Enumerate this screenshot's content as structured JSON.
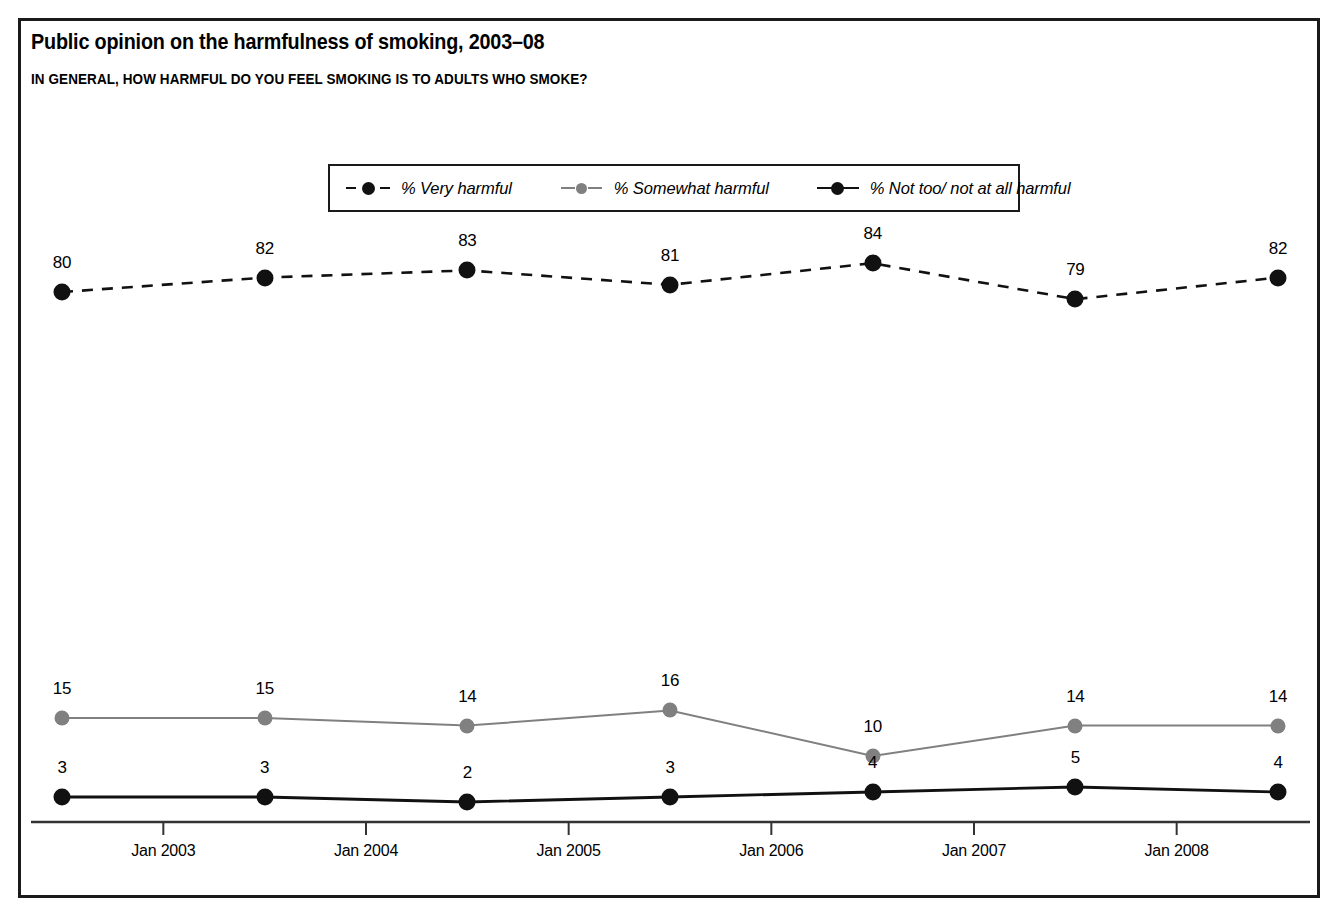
{
  "header": {
    "title": "Public opinion on the harmfulness of smoking, 2003–08",
    "subtitle": "IN GENERAL, HOW HARMFUL DO YOU FEEL SMOKING IS TO ADULTS WHO SMOKE?"
  },
  "colors": {
    "very_harmful": "#111111",
    "somewhat_harmful": "#808080",
    "not_harmful": "#111111",
    "axis": "#333333",
    "frame": "#1a1a1a",
    "background": "#ffffff"
  },
  "chart_data": {
    "type": "line",
    "title": "Public opinion on the harmfulness of smoking, 2003–08",
    "subtitle": "IN GENERAL, HOW HARMFUL DO YOU FEEL SMOKING IS TO ADULTS WHO SMOKE?",
    "xlabel": "",
    "ylabel": "",
    "grid": false,
    "legend_position": "top-center",
    "x_tick_labels": [
      "Jan 2003",
      "Jan 2004",
      "Jan 2005",
      "Jan 2006",
      "Jan 2007",
      "Jan 2008"
    ],
    "categories": [
      "2002",
      "2003",
      "2004",
      "2005",
      "2006",
      "2007",
      "2008"
    ],
    "series": [
      {
        "name": "% Very harmful",
        "color": "#111111",
        "style": "dashed",
        "values": [
          80,
          82,
          83,
          81,
          84,
          79,
          82
        ]
      },
      {
        "name": "% Somewhat harmful",
        "color": "#808080",
        "style": "solid",
        "values": [
          15,
          15,
          14,
          16,
          10,
          14,
          14
        ]
      },
      {
        "name": "% Not too/ not at all harmful",
        "color": "#111111",
        "style": "solid",
        "values": [
          3,
          3,
          2,
          3,
          4,
          5,
          4
        ]
      }
    ]
  },
  "legend": {
    "items": [
      {
        "label": "% Very harmful"
      },
      {
        "label": "% Somewhat harmful"
      },
      {
        "label": "% Not too/ not at all harmful"
      }
    ]
  },
  "axis": {
    "ticks": [
      {
        "label": "Jan 2003"
      },
      {
        "label": "Jan 2004"
      },
      {
        "label": "Jan 2005"
      },
      {
        "label": "Jan 2006"
      },
      {
        "label": "Jan 2007"
      },
      {
        "label": "Jan 2008"
      }
    ]
  },
  "labels": {
    "very_harmful": [
      "80",
      "82",
      "83",
      "81",
      "84",
      "79",
      "82"
    ],
    "somewhat_harmful": [
      "15",
      "15",
      "14",
      "16",
      "10",
      "14",
      "14"
    ],
    "not_harmful": [
      "3",
      "3",
      "2",
      "3",
      "4",
      "5",
      "4"
    ]
  }
}
